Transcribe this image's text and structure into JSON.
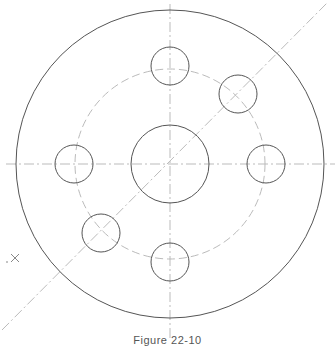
{
  "figure": {
    "caption": "Figure 22-10",
    "stroke_color": "#555555",
    "centerline_color": "#bbbbbb",
    "center": [
      170,
      164
    ],
    "outer_radius": 154,
    "center_hole_radius": 39,
    "bolt_circle_radius": 95,
    "hole_radius": 19,
    "holes": [
      {
        "name": "hole-top",
        "cx": 170,
        "cy": 66
      },
      {
        "name": "hole-upper-right",
        "cx": 238,
        "cy": 94
      },
      {
        "name": "hole-right",
        "cx": 266,
        "cy": 164
      },
      {
        "name": "hole-bottom",
        "cx": 170,
        "cy": 262
      },
      {
        "name": "hole-lower-left",
        "cx": 101,
        "cy": 233
      },
      {
        "name": "hole-left",
        "cx": 74,
        "cy": 164
      }
    ],
    "marker": {
      "symbol": "×",
      "x": 14,
      "y": 258
    }
  }
}
